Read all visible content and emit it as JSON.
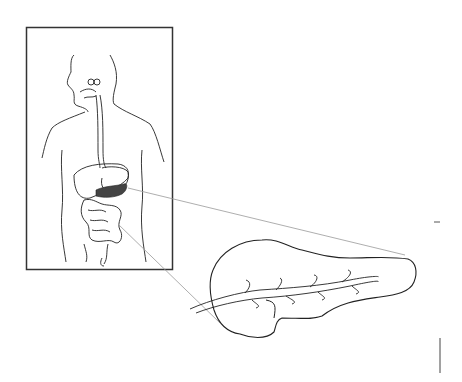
{
  "diagram": {
    "panels": [
      {
        "id": "body-inset",
        "depicts": "human torso with digestive tract, pancreas shaded"
      },
      {
        "id": "pancreas-detail",
        "depicts": "enlarged pancreas with pancreatic duct"
      }
    ],
    "colors": {
      "stroke": "#222222",
      "frame": "#333333",
      "leader": "#999999",
      "shade": "#444444",
      "background": "#ffffff"
    }
  }
}
